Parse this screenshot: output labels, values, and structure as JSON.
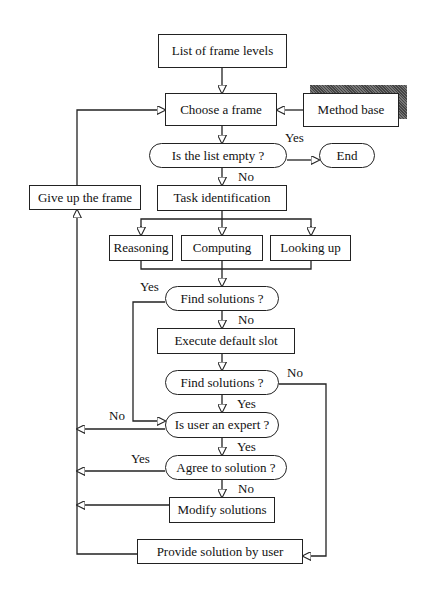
{
  "diagram": {
    "type": "flowchart",
    "nodes": {
      "list_levels": "List of frame levels",
      "choose_frame": "Choose a frame",
      "method_base": "Method base",
      "list_empty": "Is the list empty ?",
      "end": "End",
      "give_up": "Give up the frame",
      "task_id": "Task identification",
      "reasoning": "Reasoning",
      "computing": "Computing",
      "looking_up": "Looking up",
      "find_solutions_1": "Find solutions ?",
      "execute_default": "Execute default slot",
      "find_solutions_2": "Find solutions ?",
      "user_expert": "Is user an expert ?",
      "agree_solution": "Agree to solution ?",
      "modify_solutions": "Modify solutions",
      "provide_solution": "Provide solution by user"
    },
    "edge_labels": {
      "empty_yes": "Yes",
      "empty_no": "No",
      "find1_yes": "Yes",
      "find1_no": "No",
      "find2_no": "No",
      "find2_yes": "Yes",
      "expert_no": "No",
      "expert_yes": "Yes",
      "agree_yes": "Yes",
      "agree_no": "No"
    }
  }
}
